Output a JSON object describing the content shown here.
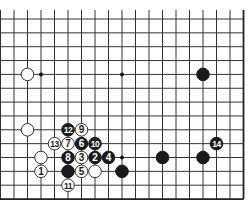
{
  "diagram": {
    "grid": {
      "columns": 19,
      "rows": 14,
      "x0": 0.5,
      "dx": 13.5,
      "y0": 19,
      "dy": 13.85,
      "top_line_start": 10,
      "right_edge": true,
      "bottom_edge": true,
      "line_color": "#333333",
      "edge_color": "#222222"
    },
    "star_points": [
      {
        "col": 3,
        "row": 4
      },
      {
        "col": 9,
        "row": 4
      },
      {
        "col": 9,
        "row": 10
      }
    ],
    "stones": [
      {
        "color": "white",
        "col": 2,
        "row": 4,
        "label": ""
      },
      {
        "color": "black",
        "col": 15,
        "row": 4,
        "label": ""
      },
      {
        "color": "white",
        "col": 2,
        "row": 8,
        "label": ""
      },
      {
        "color": "white",
        "col": 3,
        "row": 10,
        "label": ""
      },
      {
        "color": "white",
        "col": 3,
        "row": 11,
        "label": "1"
      },
      {
        "color": "black",
        "col": 7,
        "row": 10,
        "label": "2"
      },
      {
        "color": "white",
        "col": 6,
        "row": 10,
        "label": "3"
      },
      {
        "color": "black",
        "col": 8,
        "row": 10,
        "label": "4"
      },
      {
        "color": "white",
        "col": 6,
        "row": 11,
        "label": "5"
      },
      {
        "color": "black",
        "col": 6,
        "row": 9,
        "label": "6"
      },
      {
        "color": "white",
        "col": 5,
        "row": 9,
        "label": "7"
      },
      {
        "color": "black",
        "col": 5,
        "row": 10,
        "label": "8"
      },
      {
        "color": "white",
        "col": 6,
        "row": 8,
        "label": "9"
      },
      {
        "color": "black",
        "col": 7,
        "row": 9,
        "label": "10"
      },
      {
        "color": "white",
        "col": 5,
        "row": 12,
        "label": "11"
      },
      {
        "color": "black",
        "col": 5,
        "row": 8,
        "label": "12"
      },
      {
        "color": "white",
        "col": 4,
        "row": 9,
        "label": "13"
      },
      {
        "color": "black",
        "col": 16,
        "row": 9,
        "label": "14"
      },
      {
        "color": "black",
        "col": 5,
        "row": 11,
        "label": ""
      },
      {
        "color": "white",
        "col": 7,
        "row": 11,
        "label": ""
      },
      {
        "color": "black",
        "col": 9,
        "row": 11,
        "label": ""
      },
      {
        "color": "black",
        "col": 12,
        "row": 10,
        "label": ""
      },
      {
        "color": "black",
        "col": 15,
        "row": 10,
        "label": ""
      }
    ],
    "colors": {
      "black_stone": "#1a1a1a",
      "white_stone": "#ffffff",
      "white_stone_stroke": "#333333",
      "black_label": "#ffffff",
      "white_label": "#1a1a1a"
    }
  }
}
